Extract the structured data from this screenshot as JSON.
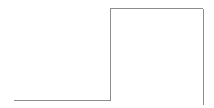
{
  "canvas": {
    "width": 214,
    "height": 108,
    "background_color": "#ffffff",
    "title": "",
    "description": "step-shaped polyline"
  },
  "chart_data": {
    "type": "line",
    "title": "",
    "subtitle": "",
    "xlabel": "",
    "ylabel": "",
    "grid": false,
    "legend": null,
    "legend_position": "none",
    "tick_labels_x": [],
    "tick_labels_y": [],
    "xlim": [
      0,
      214
    ],
    "ylim": [
      0,
      108
    ],
    "annotations": [],
    "series": [
      {
        "name": "step-waveform",
        "style": "step-post",
        "stroke_color": "#8c8c8c",
        "stroke_width": 1,
        "points": [
          {
            "x": 14,
            "y": 100.5
          },
          {
            "x": 110,
            "y": 100.5
          },
          {
            "x": 110,
            "y": 8.5
          },
          {
            "x": 203,
            "y": 8.5
          },
          {
            "x": 203,
            "y": 105
          }
        ]
      }
    ],
    "segments": [
      {
        "name": "low-level-baseline",
        "orientation": "horizontal",
        "x1": 14,
        "y1": 100.5,
        "x2": 110,
        "y2": 100.5,
        "color": "#8c8c8c"
      },
      {
        "name": "rising-edge",
        "orientation": "vertical",
        "x1": 110,
        "y1": 100.5,
        "x2": 110,
        "y2": 8.5,
        "color": "#8c8c8c"
      },
      {
        "name": "high-level-plateau",
        "orientation": "horizontal",
        "x1": 110,
        "y1": 8.5,
        "x2": 203,
        "y2": 8.5,
        "color": "#8c8c8c"
      },
      {
        "name": "falling-edge",
        "orientation": "vertical",
        "x1": 203,
        "y1": 8.5,
        "x2": 203,
        "y2": 105,
        "color": "#8c8c8c"
      }
    ]
  },
  "colors": {
    "stroke": "#8c8c8c",
    "background": "#ffffff"
  }
}
